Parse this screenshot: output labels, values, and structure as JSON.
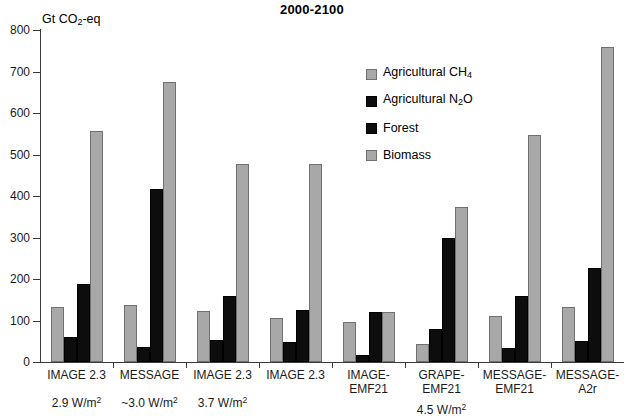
{
  "chart_data": {
    "type": "bar",
    "title": "2000-2100",
    "xlabel": "",
    "ylabel": "Gt CO2-eq",
    "ylabel_rich": "Gt CO<sub>2</sub>-eq",
    "ylim": [
      0,
      800
    ],
    "ytick_values": [
      0,
      100,
      200,
      300,
      400,
      500,
      600,
      700,
      800
    ],
    "ytick_labels": [
      "0",
      "100",
      "200",
      "300",
      "400",
      "500",
      "600",
      "700",
      "800"
    ],
    "grid": false,
    "legend_position": "upper-center-right",
    "categories": [
      "IMAGE 2.3",
      "MESSAGE",
      "IMAGE 2.3",
      "IMAGE 2.3",
      "IMAGE-\nEMF21",
      "GRAPE-\nEMF21",
      "MESSAGE-\nEMF21",
      "MESSAGE-\nA2r"
    ],
    "annotations": [
      {
        "text": "2.9 W/m",
        "sup": "2",
        "group_index": 0
      },
      {
        "text": "~3.0 W/m",
        "sup": "2",
        "group_index": 1
      },
      {
        "text": "3.7 W/m",
        "sup": "2",
        "group_index": 2
      },
      {
        "text": "4.5 W/m",
        "sup": "2",
        "group_index": 5
      }
    ],
    "series": [
      {
        "name": "Agricultural CH4",
        "name_rich": "Agricultural CH<sub>4</sub>",
        "color": "#a8a8a8",
        "style": "light",
        "values": [
          132,
          138,
          122,
          107,
          97,
          43,
          110,
          132
        ]
      },
      {
        "name": "Agricultural N2O",
        "name_rich": "Agricultural N<sub>2</sub>O",
        "color": "#0d0d0d",
        "style": "dark",
        "values": [
          60,
          35,
          53,
          48,
          18,
          80,
          33,
          50
        ]
      },
      {
        "name": "Forest",
        "name_rich": "Forest",
        "color": "#0d0d0d",
        "style": "dark",
        "values": [
          187,
          418,
          160,
          125,
          120,
          300,
          160,
          227
        ]
      },
      {
        "name": "Biomass",
        "name_rich": "Biomass",
        "color": "#a8a8a8",
        "style": "light",
        "values": [
          556,
          675,
          478,
          478,
          120,
          373,
          548,
          760
        ]
      }
    ]
  },
  "colors": {
    "light_fill": "#a8a8a8",
    "dark_fill": "#0d0d0d",
    "axis": "#3a3a3a",
    "background": "#ffffff"
  }
}
